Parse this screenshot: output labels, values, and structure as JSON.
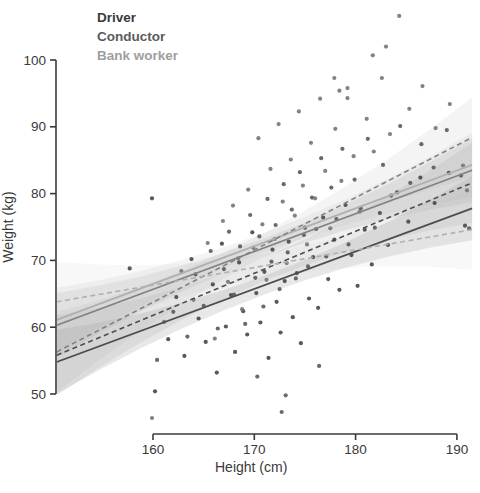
{
  "legend": {
    "items": [
      {
        "label": "Driver",
        "color": "#3a3a3a"
      },
      {
        "label": "Conductor",
        "color": "#5b5b5b"
      },
      {
        "label": "Bank worker",
        "color": "#9e9e9e"
      }
    ]
  },
  "chart_data": {
    "type": "scatter",
    "title": "",
    "xlabel": "Height (cm)",
    "ylabel": "Weight (kg)",
    "xlim": [
      150.5,
      191.5
    ],
    "ylim": [
      46,
      107
    ],
    "x_ticks": [
      160,
      170,
      180,
      190
    ],
    "y_ticks": [
      50,
      60,
      70,
      80,
      90,
      100
    ],
    "grid": false,
    "legend_position": "top-left",
    "groups": [
      {
        "name": "Driver",
        "point_color": "#474747",
        "line_color": "#4d4d4d",
        "ribbon_color": "#777777"
      },
      {
        "name": "Conductor",
        "point_color": "#5a5a5a",
        "line_color": "#828282",
        "ribbon_color": "#999999"
      },
      {
        "name": "Bank worker",
        "point_color": "#757575",
        "line_color": "#b0b0b0",
        "ribbon_color": "#bbbbbb"
      }
    ],
    "regression_lines": [
      {
        "group": 0,
        "style": "solid",
        "x": [
          150.5,
          191.5
        ],
        "y": [
          54.8,
          77.8
        ],
        "ci_halfwidth_edge": 4.8,
        "ci_halfwidth_mid": 1.4
      },
      {
        "group": 1,
        "style": "solid",
        "x": [
          150.5,
          191.5
        ],
        "y": [
          60.3,
          83.5
        ],
        "ci_halfwidth_edge": 4.8,
        "ci_halfwidth_mid": 1.4
      },
      {
        "group": 2,
        "style": "solid",
        "x": [
          150.5,
          191.5
        ],
        "y": [
          61.1,
          84.3
        ],
        "ci_halfwidth_edge": 4.8,
        "ci_halfwidth_mid": 1.4
      },
      {
        "group": 0,
        "style": "dashed",
        "x": [
          150.5,
          191.5
        ],
        "y": [
          55.8,
          81.6
        ],
        "ci_halfwidth_edge": 6.0,
        "ci_halfwidth_mid": 1.8
      },
      {
        "group": 1,
        "style": "dashed",
        "x": [
          150.5,
          191.5
        ],
        "y": [
          56.3,
          88.4
        ],
        "ci_halfwidth_edge": 6.0,
        "ci_halfwidth_mid": 1.8
      },
      {
        "group": 2,
        "style": "dashed",
        "x": [
          150.5,
          191.5
        ],
        "y": [
          63.8,
          74.6
        ],
        "ci_halfwidth_edge": 6.0,
        "ci_halfwidth_mid": 1.8
      }
    ],
    "points": [
      [
        159.9,
        79.3,
        0
      ],
      [
        157.7,
        68.8,
        0
      ],
      [
        160.2,
        50.4,
        0
      ],
      [
        161.5,
        58.2,
        0
      ],
      [
        162.3,
        64.5,
        0
      ],
      [
        163.1,
        55.7,
        0
      ],
      [
        163.8,
        70.2,
        0
      ],
      [
        164.5,
        61.3,
        0
      ],
      [
        165.2,
        57.8,
        0
      ],
      [
        165.9,
        66.4,
        0
      ],
      [
        166.3,
        53.2,
        0
      ],
      [
        166.8,
        72.5,
        0
      ],
      [
        167.2,
        60.1,
        0
      ],
      [
        167.7,
        64.8,
        0
      ],
      [
        168.1,
        56.3,
        0
      ],
      [
        168.5,
        69.7,
        0
      ],
      [
        168.9,
        62.4,
        0
      ],
      [
        169.3,
        58.9,
        0
      ],
      [
        169.8,
        74.2,
        0
      ],
      [
        170.2,
        65.1,
        0
      ],
      [
        170.6,
        60.7,
        0
      ],
      [
        171.0,
        68.3,
        0
      ],
      [
        171.4,
        55.4,
        0
      ],
      [
        171.8,
        71.6,
        0
      ],
      [
        172.2,
        63.8,
        0
      ],
      [
        172.6,
        59.2,
        0
      ],
      [
        173.0,
        66.9,
        0
      ],
      [
        173.4,
        72.8,
        0
      ],
      [
        173.8,
        61.5,
        0
      ],
      [
        174.2,
        68.1,
        0
      ],
      [
        174.6,
        57.6,
        0
      ],
      [
        175.0,
        74.9,
        0
      ],
      [
        175.4,
        64.3,
        0
      ],
      [
        175.8,
        70.5,
        0
      ],
      [
        176.3,
        62.9,
        0
      ],
      [
        176.8,
        76.4,
        0
      ],
      [
        177.3,
        67.2,
        0
      ],
      [
        177.9,
        73.1,
        0
      ],
      [
        178.4,
        65.6,
        0
      ],
      [
        179.0,
        78.3,
        0
      ],
      [
        179.6,
        70.8,
        0
      ],
      [
        180.2,
        66.2,
        0
      ],
      [
        180.9,
        74.6,
        0
      ],
      [
        181.6,
        69.4,
        0
      ],
      [
        182.4,
        77.1,
        0
      ],
      [
        183.2,
        72.3,
        0
      ],
      [
        184.1,
        80.2,
        0
      ],
      [
        185.2,
        75.8,
        0
      ],
      [
        186.4,
        82.4,
        0
      ],
      [
        187.8,
        78.6,
        0
      ],
      [
        189.2,
        83.1,
        0
      ],
      [
        190.8,
        75.2,
        0
      ],
      [
        160.4,
        55.1,
        1
      ],
      [
        162.0,
        62.3,
        1
      ],
      [
        163.4,
        58.6,
        1
      ],
      [
        164.2,
        67.9,
        1
      ],
      [
        165.0,
        63.2,
        1
      ],
      [
        165.7,
        71.4,
        1
      ],
      [
        166.4,
        59.8,
        1
      ],
      [
        167.0,
        68.7,
        1
      ],
      [
        167.5,
        74.3,
        1
      ],
      [
        168.0,
        64.9,
        1
      ],
      [
        168.6,
        72.1,
        1
      ],
      [
        169.1,
        60.5,
        1
      ],
      [
        169.6,
        76.8,
        1
      ],
      [
        170.1,
        67.4,
        1
      ],
      [
        170.5,
        73.6,
        1
      ],
      [
        170.9,
        63.1,
        1
      ],
      [
        171.3,
        79.2,
        1
      ],
      [
        171.7,
        69.8,
        1
      ],
      [
        172.1,
        75.3,
        1
      ],
      [
        172.5,
        65.7,
        1
      ],
      [
        172.9,
        81.4,
        1
      ],
      [
        173.3,
        71.2,
        1
      ],
      [
        173.7,
        77.6,
        1
      ],
      [
        174.1,
        67.3,
        1
      ],
      [
        174.5,
        83.2,
        1
      ],
      [
        174.9,
        73.8,
        1
      ],
      [
        175.3,
        69.1,
        1
      ],
      [
        175.7,
        79.4,
        1
      ],
      [
        176.1,
        74.7,
        1
      ],
      [
        176.6,
        85.3,
        1
      ],
      [
        177.1,
        70.6,
        1
      ],
      [
        177.6,
        80.9,
        1
      ],
      [
        178.1,
        76.2,
        1
      ],
      [
        178.7,
        86.7,
        1
      ],
      [
        179.3,
        72.4,
        1
      ],
      [
        179.9,
        82.1,
        1
      ],
      [
        180.5,
        77.8,
        1
      ],
      [
        181.2,
        88.2,
        1
      ],
      [
        181.9,
        74.9,
        1
      ],
      [
        182.7,
        84.3,
        1
      ],
      [
        183.5,
        79.7,
        1
      ],
      [
        184.4,
        90.1,
        1
      ],
      [
        185.4,
        81.6,
        1
      ],
      [
        186.5,
        87.4,
        1
      ],
      [
        187.7,
        83.9,
        1
      ],
      [
        189.0,
        89.5,
        1
      ],
      [
        190.4,
        82.7,
        1
      ],
      [
        191.2,
        74.8,
        1
      ],
      [
        170.3,
        52.6,
        1
      ],
      [
        173.1,
        49.8,
        1
      ],
      [
        176.4,
        54.2,
        1
      ],
      [
        172.7,
        47.3,
        1
      ],
      [
        161.1,
        60.8,
        2
      ],
      [
        162.8,
        68.4,
        2
      ],
      [
        164.0,
        64.1,
        2
      ],
      [
        165.4,
        72.6,
        2
      ],
      [
        166.1,
        58.3,
        2
      ],
      [
        166.9,
        75.9,
        2
      ],
      [
        167.4,
        66.8,
        2
      ],
      [
        167.9,
        78.2,
        2
      ],
      [
        168.4,
        70.3,
        2
      ],
      [
        168.8,
        62.7,
        2
      ],
      [
        169.4,
        80.6,
        2
      ],
      [
        169.9,
        71.9,
        2
      ],
      [
        170.4,
        88.3,
        2
      ],
      [
        170.8,
        75.4,
        2
      ],
      [
        171.2,
        67.1,
        2
      ],
      [
        171.6,
        83.7,
        2
      ],
      [
        172.0,
        73.2,
        2
      ],
      [
        172.4,
        90.4,
        2
      ],
      [
        172.8,
        78.8,
        2
      ],
      [
        173.2,
        69.6,
        2
      ],
      [
        173.6,
        85.1,
        2
      ],
      [
        174.0,
        76.7,
        2
      ],
      [
        174.4,
        92.3,
        2
      ],
      [
        174.8,
        81.2,
        2
      ],
      [
        175.2,
        72.4,
        2
      ],
      [
        175.6,
        87.6,
        2
      ],
      [
        176.0,
        79.3,
        2
      ],
      [
        176.5,
        94.2,
        2
      ],
      [
        177.0,
        83.4,
        2
      ],
      [
        177.5,
        74.8,
        2
      ],
      [
        178.0,
        89.7,
        2
      ],
      [
        178.6,
        81.9,
        2
      ],
      [
        179.2,
        95.8,
        2
      ],
      [
        179.8,
        85.6,
        2
      ],
      [
        180.4,
        77.3,
        2
      ],
      [
        181.1,
        91.2,
        2
      ],
      [
        181.8,
        86.3,
        2
      ],
      [
        182.6,
        97.3,
        2
      ],
      [
        183.4,
        88.9,
        2
      ],
      [
        184.3,
        106.6,
        2
      ],
      [
        185.3,
        92.7,
        2
      ],
      [
        186.6,
        96.1,
        2
      ],
      [
        187.9,
        89.8,
        2
      ],
      [
        189.3,
        93.4,
        2
      ],
      [
        190.6,
        84.2,
        2
      ],
      [
        191.0,
        80.5,
        2
      ],
      [
        181.7,
        100.7,
        2
      ],
      [
        183.0,
        102.0,
        2
      ],
      [
        177.9,
        97.3,
        2
      ],
      [
        178.4,
        95.4,
        2
      ],
      [
        179.2,
        94.3,
        2
      ],
      [
        159.9,
        46.4,
        2
      ]
    ]
  }
}
